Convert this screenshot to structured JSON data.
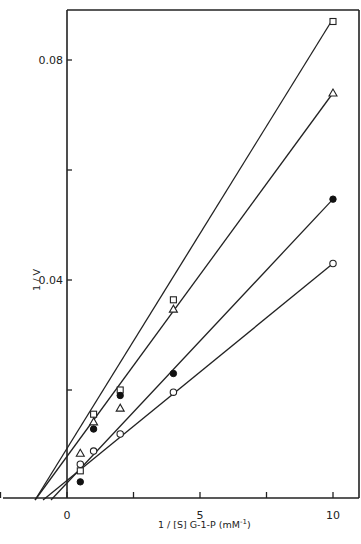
{
  "chart_data": {
    "type": "scatter",
    "title": "",
    "xlabel": "1/[S] G-1-P (mM⁻¹)",
    "ylabel": "1/V",
    "xlim": [
      -2.5,
      11
    ],
    "ylim": [
      0,
      0.092
    ],
    "x_ticks": [
      {
        "value": 0,
        "label": "0"
      },
      {
        "value": 5,
        "label": "5"
      },
      {
        "value": 10,
        "label": "10"
      }
    ],
    "x_minor_ticks": [
      -2.5,
      2.5,
      7.5
    ],
    "y_ticks": [
      {
        "value": 0.04,
        "label": "0.04"
      },
      {
        "value": 0.08,
        "label": "0.08"
      }
    ],
    "y_minor_ticks": [
      0.02,
      0.06
    ],
    "grid": false,
    "legend": null,
    "series": [
      {
        "name": "open-square",
        "marker": "square-open",
        "points": [
          [
            0.5,
            0.0053
          ],
          [
            1,
            0.0156
          ],
          [
            2,
            0.02
          ],
          [
            4,
            0.0364
          ],
          [
            10,
            0.087
          ]
        ],
        "fit_line": {
          "x0": -1.2,
          "y0": 0.0,
          "x1": 10,
          "y1": 0.0875
        }
      },
      {
        "name": "open-triangle",
        "marker": "triangle-open",
        "points": [
          [
            0.5,
            0.0085
          ],
          [
            1,
            0.0142
          ],
          [
            2,
            0.0167
          ],
          [
            4,
            0.0347
          ],
          [
            10,
            0.074
          ]
        ],
        "fit_line": {
          "x0": -1.2,
          "y0": 0.0,
          "x1": 10,
          "y1": 0.074
        }
      },
      {
        "name": "filled-circle",
        "marker": "circle-filled",
        "points": [
          [
            0.5,
            0.0033
          ],
          [
            1,
            0.0129
          ],
          [
            2,
            0.019
          ],
          [
            4,
            0.023
          ],
          [
            10,
            0.0547
          ]
        ],
        "fit_line": {
          "x0": -0.6,
          "y0": 0.0,
          "x1": 10,
          "y1": 0.0547
        }
      },
      {
        "name": "open-circle",
        "marker": "circle-open",
        "points": [
          [
            0.5,
            0.0065
          ],
          [
            1,
            0.0089
          ],
          [
            2,
            0.012
          ],
          [
            4,
            0.0196
          ],
          [
            10,
            0.043
          ]
        ],
        "fit_line": {
          "x0": -0.9,
          "y0": 0.0,
          "x1": 10,
          "y1": 0.043
        }
      }
    ]
  },
  "labels": {
    "y_axis_title": "1 / V",
    "x_axis_title_main": "1 / [S]   G-1-P   (mM",
    "x_axis_title_sup": "-1",
    "x_axis_title_end": ")"
  }
}
